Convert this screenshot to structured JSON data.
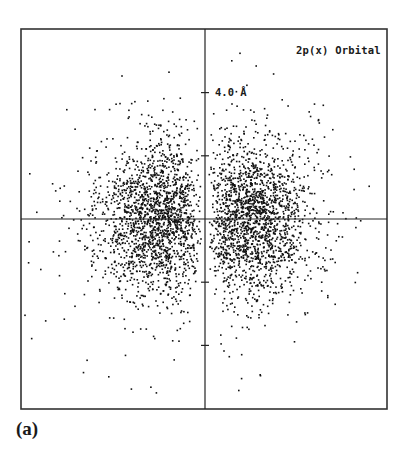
{
  "figure": {
    "panel_label": "(a)"
  },
  "chart_data": {
    "type": "scatter",
    "title": "2p(x) Orbital",
    "xlabel": "",
    "ylabel": "",
    "units": "Å",
    "annotations": [
      {
        "text": "4.0 Å",
        "anchor": "y-axis tick at +4.0 Å"
      }
    ],
    "y_axis_ticks_angstrom": [
      -4.0,
      -2.0,
      2.0,
      4.0
    ],
    "y_axis_labeled_tick": {
      "value": 4.0,
      "label": "4.0 Å"
    },
    "x_axis_ticks_angstrom": [],
    "xlim": [
      -5.8,
      5.8
    ],
    "ylim": [
      -6.0,
      6.0
    ],
    "grid": false,
    "legend": null,
    "axes_through_origin": true,
    "series": [
      {
        "name": "left lobe",
        "center_angstrom": [
          -1.4,
          0.0
        ],
        "spread_angstrom": [
          1.5,
          1.6
        ],
        "approx_points": 1900
      },
      {
        "name": "right lobe",
        "center_angstrom": [
          1.4,
          0.0
        ],
        "spread_angstrom": [
          1.5,
          1.6
        ],
        "approx_points": 1900
      }
    ],
    "point_color": "#111111"
  },
  "layout": {
    "box": {
      "left": 21,
      "top": 29,
      "right": 387,
      "bottom": 409
    },
    "origin_px": [
      205,
      219
    ],
    "px_per_angstrom": 31.6,
    "axis_color": "#222222",
    "box_color": "#333333"
  }
}
